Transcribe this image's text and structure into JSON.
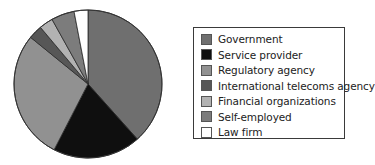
{
  "chart_data": {
    "type": "pie",
    "title": "",
    "start_angle_deg": 0,
    "direction": "clockwise",
    "legend_position": "right",
    "categories": [
      "Government",
      "Service provider",
      "Regulatory agency",
      "International telecoms agency",
      "Financial organizations",
      "Self-employed",
      "Law firm"
    ],
    "values": [
      38,
      19,
      28,
      3,
      3,
      5,
      3
    ],
    "unit": "%",
    "colors": [
      "#6f6f6f",
      "#0f0f0f",
      "#919191",
      "#575757",
      "#b2b2b2",
      "#7c7c7c",
      "#ffffff"
    ]
  },
  "legend": {
    "items": [
      {
        "label": "Government",
        "color": "#6f6f6f"
      },
      {
        "label": "Service provider",
        "color": "#0f0f0f"
      },
      {
        "label": "Regulatory agency",
        "color": "#919191"
      },
      {
        "label": "International telecoms agency",
        "color": "#575757"
      },
      {
        "label": "Financial organizations",
        "color": "#b2b2b2"
      },
      {
        "label": "Self-employed",
        "color": "#7c7c7c"
      },
      {
        "label": "Law firm",
        "color": "#ffffff"
      }
    ]
  }
}
